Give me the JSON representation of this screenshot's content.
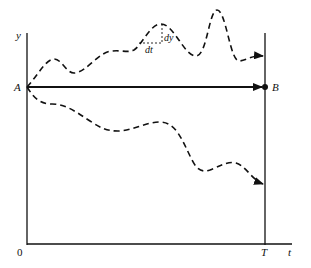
{
  "figure": {
    "colors": {
      "ink": "#111111",
      "background": "#ffffff"
    },
    "axes": {
      "y_label": "y",
      "t_label": "t",
      "origin_label": "0",
      "terminal_label": "T"
    },
    "points": {
      "start_label": "A",
      "end_label": "B"
    },
    "increment_labels": {
      "dt": "dt",
      "dy": "dy"
    },
    "paths": [
      {
        "name": "straight-path",
        "style": "solid",
        "from": "A",
        "to": "B"
      },
      {
        "name": "upper-path",
        "style": "dashed",
        "from": "A",
        "to": "T-line"
      },
      {
        "name": "lower-path",
        "style": "dashed",
        "from": "A",
        "to": "T-line"
      }
    ]
  }
}
